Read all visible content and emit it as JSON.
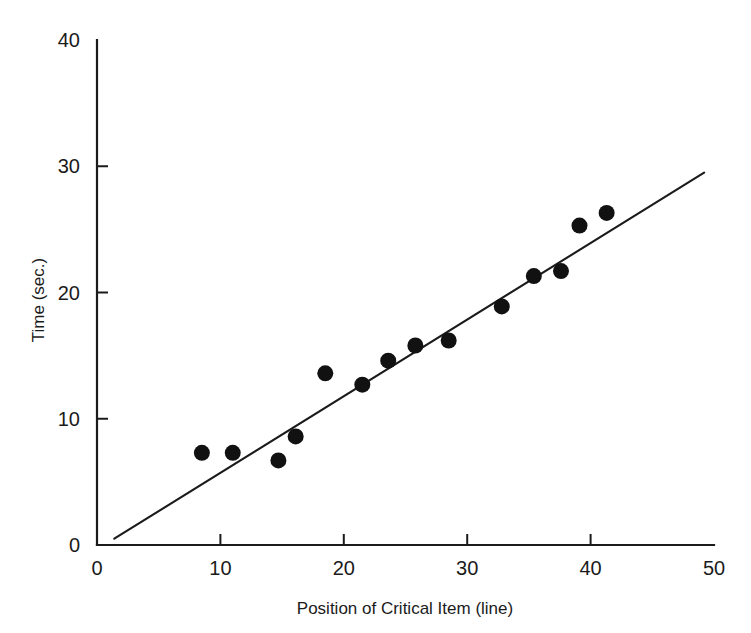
{
  "chart_data": {
    "type": "scatter",
    "title": "",
    "subtitle": "",
    "xlabel": "Position of Critical Item (line)",
    "ylabel": "Time (sec.)",
    "xlim": [
      0,
      50
    ],
    "ylim": [
      0,
      40
    ],
    "xticks": [
      0,
      10,
      20,
      30,
      40,
      50
    ],
    "yticks": [
      0,
      10,
      20,
      30,
      40
    ],
    "xtick_labels": [
      "0",
      "10",
      "20",
      "30",
      "40",
      "50"
    ],
    "ytick_labels": [
      "0",
      "10",
      "20",
      "30",
      "40"
    ],
    "grid": false,
    "legend": null,
    "legend_position": "none",
    "marker": "filled-circle",
    "marker_color": "#111111",
    "axis_color": "#1b1b1b",
    "background_color": "#ffffff",
    "points": [
      {
        "x": 8.5,
        "y": 7.3
      },
      {
        "x": 11.0,
        "y": 7.3
      },
      {
        "x": 14.7,
        "y": 6.7
      },
      {
        "x": 16.1,
        "y": 8.6
      },
      {
        "x": 18.5,
        "y": 13.6
      },
      {
        "x": 21.5,
        "y": 12.7
      },
      {
        "x": 23.6,
        "y": 14.6
      },
      {
        "x": 25.8,
        "y": 15.8
      },
      {
        "x": 28.5,
        "y": 16.2
      },
      {
        "x": 32.8,
        "y": 18.9
      },
      {
        "x": 35.4,
        "y": 21.3
      },
      {
        "x": 37.6,
        "y": 21.7
      },
      {
        "x": 39.1,
        "y": 25.3
      },
      {
        "x": 41.3,
        "y": 26.3
      }
    ],
    "series": [
      {
        "name": "Observed times",
        "type": "scatter",
        "x": [
          8.5,
          11.0,
          14.7,
          16.1,
          18.5,
          21.5,
          23.6,
          25.8,
          28.5,
          32.8,
          35.4,
          37.6,
          39.1,
          41.3
        ],
        "values": [
          7.3,
          7.3,
          6.7,
          8.6,
          13.6,
          12.7,
          14.6,
          15.8,
          16.2,
          18.9,
          21.3,
          21.7,
          25.3,
          26.3
        ]
      },
      {
        "name": "Fitted regression line",
        "type": "line",
        "x": [
          1.4,
          49.2
        ],
        "values": [
          0.5,
          29.5
        ]
      }
    ],
    "fit_line": {
      "x_start": 1.4,
      "y_start": 0.5,
      "x_end": 49.2,
      "y_end": 29.5
    }
  }
}
